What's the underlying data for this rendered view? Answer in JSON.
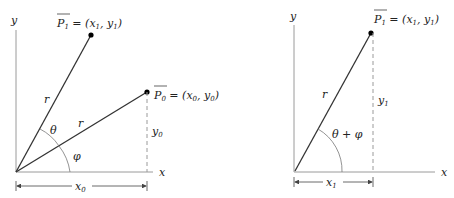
{
  "left_diagram": {
    "axis_x_label": "x",
    "axis_y_label": "y",
    "point_p1": {
      "name": "P",
      "sub": "1",
      "eq": " = (",
      "x": "x",
      "xs": "1",
      "comma": ", ",
      "y": "y",
      "ys": "1",
      "close": ")"
    },
    "point_p0": {
      "name": "P",
      "sub": "0",
      "eq": " = (",
      "x": "x",
      "xs": "0",
      "comma": ", ",
      "y": "y",
      "ys": "0",
      "close": ")"
    },
    "r_label_1": "r",
    "r_label_0": "r",
    "theta_label": "θ",
    "phi_label": "φ",
    "y0_label": {
      "v": "y",
      "s": "0"
    },
    "x0_label": {
      "v": "x",
      "s": "0"
    }
  },
  "right_diagram": {
    "axis_x_label": "x",
    "axis_y_label": "y",
    "point_p1": {
      "name": "P",
      "sub": "1",
      "eq": " = (",
      "x": "x",
      "xs": "1",
      "comma": ", ",
      "y": "y",
      "ys": "1",
      "close": ")"
    },
    "r_label": "r",
    "angle_label": "θ + φ",
    "y1_label": {
      "v": "y",
      "s": "1"
    },
    "x1_label": {
      "v": "x",
      "s": "1"
    }
  },
  "colors": {
    "axis": "#9a9a9a",
    "vector": "#333333",
    "dashed": "#9a9a9a",
    "point": "#000000"
  }
}
